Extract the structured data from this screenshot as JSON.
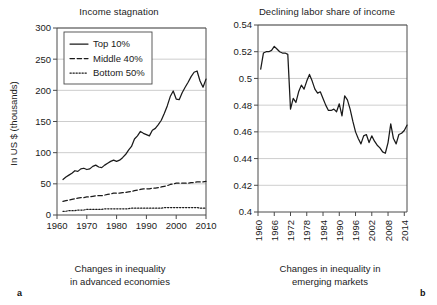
{
  "figure": {
    "panels": [
      {
        "letter": "a",
        "title": "Income stagnation",
        "caption_line1": "Changes in inequality",
        "caption_line2": "in advanced economies"
      },
      {
        "letter": "b",
        "title": "Declining labor share of income",
        "caption_line1": "Changes in inequality in",
        "caption_line2": "emerging markets"
      }
    ]
  },
  "chart_data": [
    {
      "type": "line",
      "title": "Income stagnation",
      "xlabel": "Changes in inequality in advanced economies",
      "ylabel": "In US $ (thousands)",
      "xlim": [
        1960,
        2010
      ],
      "ylim": [
        0,
        300
      ],
      "xticks": [
        1960,
        1970,
        1980,
        1990,
        2000,
        2010
      ],
      "xticklabels": [
        "1960",
        "1970",
        "1980",
        "1990",
        "2000",
        "2010"
      ],
      "yticks": [
        0,
        50,
        100,
        150,
        200,
        250,
        300
      ],
      "yticklabels": [
        "0",
        "50",
        "100",
        "150",
        "200",
        "250",
        "300"
      ],
      "grid": "horizontal",
      "legend_position": "upper-left",
      "x": [
        1962,
        1963,
        1964,
        1965,
        1966,
        1967,
        1968,
        1969,
        1970,
        1971,
        1972,
        1973,
        1974,
        1975,
        1976,
        1977,
        1978,
        1979,
        1980,
        1981,
        1982,
        1983,
        1984,
        1985,
        1986,
        1987,
        1988,
        1989,
        1990,
        1991,
        1992,
        1993,
        1994,
        1995,
        1996,
        1997,
        1998,
        1999,
        2000,
        2001,
        2002,
        2003,
        2004,
        2005,
        2006,
        2007,
        2008,
        2009,
        2010
      ],
      "series": [
        {
          "name": "Top 10%",
          "style": "solid",
          "values": [
            57,
            61,
            64,
            67,
            71,
            70,
            74,
            75,
            73,
            74,
            78,
            80,
            77,
            76,
            80,
            83,
            86,
            88,
            86,
            88,
            92,
            97,
            104,
            110,
            122,
            127,
            134,
            131,
            129,
            127,
            136,
            139,
            145,
            152,
            163,
            175,
            190,
            199,
            186,
            185,
            196,
            205,
            213,
            222,
            229,
            231,
            215,
            205,
            218,
            224,
            219,
            231,
            225,
            236,
            240
          ]
        },
        {
          "name": "Middle 40%",
          "style": "dashed",
          "values": [
            22,
            23,
            24,
            25,
            26,
            27,
            28,
            28,
            29,
            29,
            30,
            31,
            31,
            31,
            32,
            33,
            34,
            35,
            35,
            35,
            36,
            36,
            37,
            38,
            39,
            40,
            41,
            42,
            42,
            42,
            43,
            43,
            44,
            45,
            46,
            47,
            49,
            50,
            51,
            51,
            51,
            51,
            51,
            52,
            52,
            53,
            53,
            53,
            54,
            55,
            56
          ]
        },
        {
          "name": "Bottom 50%",
          "style": "dotted",
          "values": [
            6,
            6,
            7,
            7,
            7,
            8,
            8,
            8,
            9,
            9,
            9,
            9,
            9,
            9,
            10,
            10,
            10,
            10,
            10,
            10,
            10,
            10,
            10,
            11,
            11,
            11,
            11,
            11,
            11,
            11,
            11,
            11,
            11,
            11,
            12,
            12,
            12,
            12,
            12,
            12,
            12,
            12,
            12,
            12,
            12,
            12,
            11,
            11,
            11,
            11,
            11
          ]
        }
      ]
    },
    {
      "type": "line",
      "title": "Declining labor share of income",
      "xlabel": "Changes in inequality in emerging markets",
      "ylabel": "",
      "xlim": [
        1960,
        2015
      ],
      "ylim": [
        0.4,
        0.54
      ],
      "xticks": [
        1960,
        1966,
        1972,
        1978,
        1984,
        1990,
        1996,
        2002,
        2008,
        2014
      ],
      "xticklabels": [
        "1960",
        "1966",
        "1972",
        "1978",
        "1984",
        "1990",
        "1996",
        "2002",
        "2008",
        "2014"
      ],
      "yticks": [
        0.4,
        0.42,
        0.44,
        0.46,
        0.48,
        0.5,
        0.52,
        0.54
      ],
      "yticklabels": [
        "0.4",
        "0.42",
        "0.44",
        "0.46",
        "0.48",
        "0.5",
        "0.52",
        "0.54"
      ],
      "grid": "horizontal",
      "legend_position": "none",
      "x": [
        1961,
        1962,
        1963,
        1964,
        1965,
        1966,
        1967,
        1968,
        1969,
        1970,
        1971,
        1972,
        1973,
        1974,
        1975,
        1976,
        1977,
        1978,
        1979,
        1980,
        1981,
        1982,
        1983,
        1984,
        1985,
        1986,
        1987,
        1988,
        1989,
        1990,
        1991,
        1992,
        1993,
        1994,
        1995,
        1996,
        1997,
        1998,
        1999,
        2000,
        2001,
        2002,
        2003,
        2004,
        2005,
        2006,
        2007,
        2008,
        2009,
        2010,
        2011,
        2012,
        2013,
        2014,
        2015
      ],
      "series": [
        {
          "name": "Labor share of income",
          "style": "solid",
          "values": [
            0.507,
            0.519,
            0.52,
            0.52,
            0.521,
            0.524,
            0.522,
            0.52,
            0.519,
            0.519,
            0.518,
            0.477,
            0.485,
            0.482,
            0.49,
            0.495,
            0.492,
            0.498,
            0.503,
            0.498,
            0.492,
            0.489,
            0.49,
            0.485,
            0.48,
            0.476,
            0.476,
            0.477,
            0.475,
            0.481,
            0.472,
            0.487,
            0.484,
            0.477,
            0.468,
            0.46,
            0.455,
            0.451,
            0.457,
            0.458,
            0.452,
            0.457,
            0.453,
            0.45,
            0.448,
            0.445,
            0.444,
            0.452,
            0.466,
            0.455,
            0.451,
            0.458,
            0.459,
            0.461,
            0.465
          ]
        }
      ]
    }
  ]
}
